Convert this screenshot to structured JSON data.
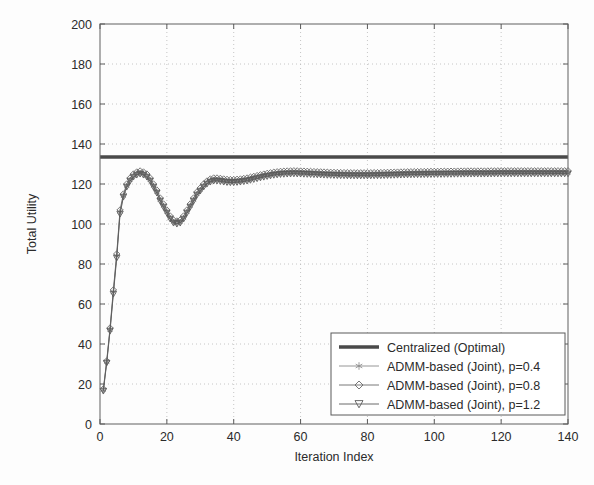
{
  "chart_data": {
    "type": "line",
    "title": "",
    "xlabel": "Iteration Index",
    "ylabel": "Total Utility",
    "xlim": [
      0,
      140
    ],
    "ylim": [
      0,
      200
    ],
    "xticks": [
      0,
      20,
      40,
      60,
      80,
      100,
      120,
      140
    ],
    "yticks": [
      0,
      20,
      40,
      60,
      80,
      100,
      120,
      140,
      160,
      180,
      200
    ],
    "grid": true,
    "legend_position": "lower right",
    "series": [
      {
        "name": "Centralized (Optimal)",
        "marker": "none",
        "linewidth": "thick",
        "color": "#4a4a4a",
        "constant_value": 133.5,
        "x": [
          0,
          140
        ],
        "values": [
          133.5,
          133.5
        ]
      },
      {
        "name": "ADMM-based (Joint), p=0.4",
        "marker": "asterisk",
        "color": "#8a8a8a",
        "x": [
          1,
          2,
          3,
          4,
          5,
          6,
          7,
          8,
          9,
          10,
          11,
          12,
          13,
          14,
          15,
          16,
          17,
          18,
          19,
          20,
          21,
          22,
          23,
          24,
          25,
          26,
          27,
          28,
          29,
          30,
          31,
          32,
          33,
          34,
          35,
          36,
          37,
          38,
          39,
          40,
          42,
          44,
          46,
          48,
          50,
          52,
          54,
          56,
          58,
          60,
          64,
          68,
          72,
          76,
          80,
          84,
          88,
          92,
          96,
          100,
          105,
          110,
          115,
          120,
          125,
          130,
          135,
          140
        ],
        "values": [
          17,
          31,
          47,
          66,
          84,
          106,
          114,
          119,
          122,
          124,
          125,
          125.5,
          125,
          124,
          122,
          119,
          116,
          112,
          109,
          106,
          103,
          101,
          100.5,
          101,
          103,
          106,
          109,
          112,
          115,
          117,
          119,
          120.5,
          121.5,
          122,
          122,
          121.8,
          121.5,
          121.3,
          121.2,
          121.2,
          121.5,
          122,
          122.8,
          123.6,
          124.3,
          124.9,
          125.3,
          125.5,
          125.6,
          125.5,
          125.2,
          124.9,
          124.7,
          124.6,
          124.6,
          124.7,
          124.9,
          125.1,
          125.2,
          125.3,
          125.4,
          125.5,
          125.5,
          125.6,
          125.6,
          125.6,
          125.6,
          125.6
        ]
      },
      {
        "name": "ADMM-based (Joint), p=0.8",
        "marker": "diamond",
        "color": "#6a6a6a",
        "x": [
          1,
          2,
          3,
          4,
          5,
          6,
          7,
          8,
          9,
          10,
          11,
          12,
          13,
          14,
          15,
          16,
          17,
          18,
          19,
          20,
          21,
          22,
          23,
          24,
          25,
          26,
          27,
          28,
          29,
          30,
          31,
          32,
          33,
          34,
          35,
          36,
          37,
          38,
          39,
          40,
          42,
          44,
          46,
          48,
          50,
          52,
          54,
          56,
          58,
          60,
          64,
          68,
          72,
          76,
          80,
          84,
          88,
          92,
          96,
          100,
          105,
          110,
          115,
          120,
          125,
          130,
          135,
          140
        ],
        "values": [
          17.5,
          31.5,
          48,
          67,
          85,
          107,
          115,
          120,
          123,
          125,
          126,
          126.5,
          126,
          125,
          123,
          120,
          117,
          113,
          110,
          107,
          104,
          102,
          101.5,
          102,
          104,
          107,
          110,
          113,
          116,
          118,
          120,
          121.5,
          122.5,
          123,
          123,
          122.8,
          122.5,
          122.3,
          122.2,
          122.2,
          122.5,
          123,
          123.8,
          124.6,
          125.3,
          125.9,
          126.3,
          126.5,
          126.6,
          126.5,
          126.2,
          125.9,
          125.7,
          125.6,
          125.6,
          125.7,
          125.9,
          126.1,
          126.2,
          126.3,
          126.4,
          126.5,
          126.5,
          126.6,
          126.6,
          126.6,
          126.6,
          126.6
        ]
      },
      {
        "name": "ADMM-based (Joint), p=1.2",
        "marker": "triangle-down",
        "color": "#5a5a5a",
        "x": [
          1,
          2,
          3,
          4,
          5,
          6,
          7,
          8,
          9,
          10,
          11,
          12,
          13,
          14,
          15,
          16,
          17,
          18,
          19,
          20,
          21,
          22,
          23,
          24,
          25,
          26,
          27,
          28,
          29,
          30,
          31,
          32,
          33,
          34,
          35,
          36,
          37,
          38,
          39,
          40,
          42,
          44,
          46,
          48,
          50,
          52,
          54,
          56,
          58,
          60,
          64,
          68,
          72,
          76,
          80,
          84,
          88,
          92,
          96,
          100,
          105,
          110,
          115,
          120,
          125,
          130,
          135,
          140
        ],
        "values": [
          16.5,
          30.5,
          46.5,
          65,
          83,
          105,
          113.5,
          118.5,
          121.5,
          123.5,
          124.5,
          125,
          124.5,
          123.5,
          121.5,
          118.5,
          115.5,
          111.5,
          108.5,
          105.5,
          102.5,
          100.5,
          100,
          100.5,
          102.5,
          105.5,
          108.5,
          111.5,
          114.5,
          116.5,
          118.5,
          120,
          121,
          121.5,
          121.5,
          121.3,
          121,
          120.8,
          120.7,
          120.7,
          121,
          121.5,
          122.3,
          123.1,
          123.8,
          124.4,
          124.8,
          125,
          125.1,
          125,
          124.7,
          124.4,
          124.2,
          124.1,
          124.1,
          124.2,
          124.4,
          124.6,
          124.7,
          124.8,
          124.9,
          125,
          125,
          125.1,
          125.1,
          125.1,
          125.1,
          125.1
        ]
      }
    ]
  },
  "legend": {
    "entries": [
      "Centralized (Optimal)",
      "ADMM-based (Joint), p=0.4",
      "ADMM-based (Joint), p=0.8",
      "ADMM-based (Joint), p=1.2"
    ]
  },
  "axes": {
    "x_title": "Iteration Index",
    "y_title": "Total Utility",
    "x_tick_labels": [
      "0",
      "20",
      "40",
      "60",
      "80",
      "100",
      "120",
      "140"
    ],
    "y_tick_labels": [
      "0",
      "20",
      "40",
      "60",
      "80",
      "100",
      "120",
      "140",
      "160",
      "180",
      "200"
    ]
  },
  "colors": {
    "optimal_line": "#4a4a4a",
    "series_p04": "#8a8a8a",
    "series_p08": "#6a6a6a",
    "series_p12": "#5a5a5a",
    "frame": "#6e6e6e",
    "grid": "#b8b8b8",
    "background": "#fdfdfd"
  }
}
